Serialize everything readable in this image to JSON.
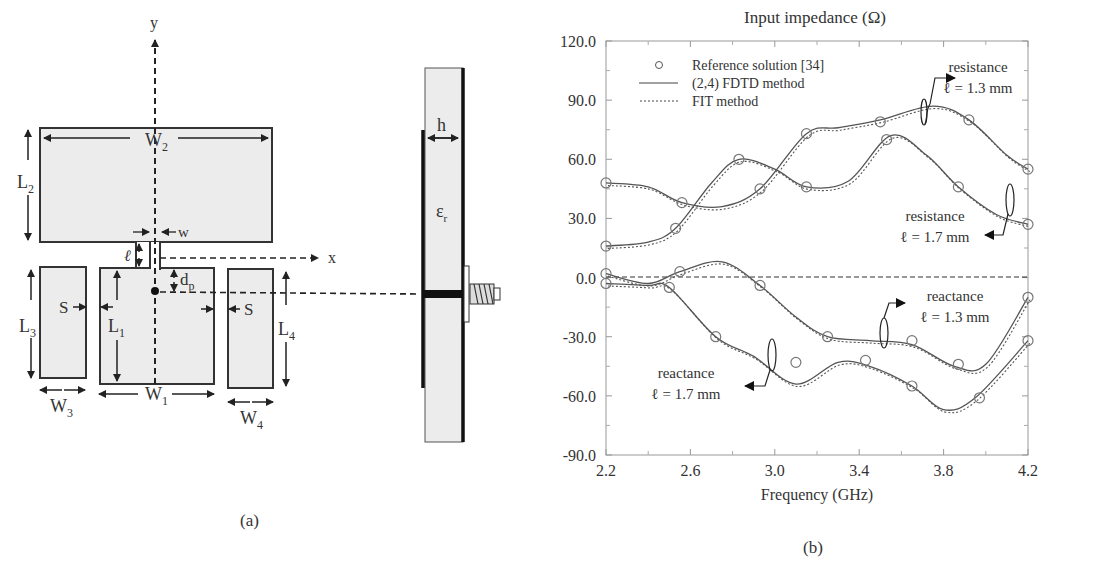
{
  "figure_a": {
    "caption": "(a)",
    "labels": {
      "y_axis": "y",
      "x_axis": "x",
      "W2": "W",
      "W2_sub": "2",
      "L2": "L",
      "L2_sub": "2",
      "w": "w",
      "ell": "ℓ",
      "dp": "d",
      "dp_sub": "p",
      "L3": "L",
      "L3_sub": "3",
      "L1": "L",
      "L1_sub": "1",
      "L4": "L",
      "L4_sub": "4",
      "S_left": "S",
      "S_right": "S",
      "W3": "W",
      "W3_sub": "3",
      "W1": "W",
      "W1_sub": "1",
      "W4": "W",
      "W4_sub": "4",
      "h": "h",
      "eps": "ε",
      "eps_sub": "r"
    }
  },
  "figure_b": {
    "caption": "(b)",
    "annotations": [
      {
        "name": "resistance",
        "sub": "ℓ = 1.3 mm"
      },
      {
        "name": "resistance",
        "sub": "ℓ = 1.7 mm"
      },
      {
        "name": "reactance",
        "sub": "ℓ = 1.3 mm"
      },
      {
        "name": "reactance",
        "sub": "ℓ = 1.7 mm"
      }
    ],
    "legend": [
      {
        "label": "Reference solution [34]",
        "style": "circle"
      },
      {
        "label": "(2,4) FDTD method",
        "style": "solid"
      },
      {
        "label": "FIT method",
        "style": "dotted"
      }
    ]
  },
  "chart_data": {
    "type": "line",
    "title": "Input impedance (Ω)",
    "xlabel": "Frequency (GHz)",
    "ylabel": "",
    "xlim": [
      2.2,
      4.2
    ],
    "ylim": [
      -90,
      120
    ],
    "x_ticks": [
      "2.2",
      "2.6",
      "3.0",
      "3.4",
      "3.8",
      "4.2"
    ],
    "y_ticks": [
      "120.0",
      "90.0",
      "60.0",
      "30.0",
      "0.0",
      "-30.0",
      "-60.0",
      "-90.0"
    ],
    "grid": false,
    "legend_position": "upper left",
    "series": [
      {
        "name": "resistance ℓ = 1.3 mm (FDTD)",
        "x": [
          2.2,
          2.4,
          2.56,
          2.75,
          2.93,
          3.15,
          3.3,
          3.5,
          3.75,
          3.92,
          4.1,
          4.2
        ],
        "values": [
          48,
          46,
          38,
          36,
          45,
          73,
          76,
          80,
          87,
          80,
          62,
          55
        ]
      },
      {
        "name": "resistance ℓ = 1.7 mm (FDTD)",
        "x": [
          2.2,
          2.4,
          2.53,
          2.7,
          2.83,
          3.0,
          3.15,
          3.35,
          3.55,
          3.72,
          3.87,
          4.05,
          4.2
        ],
        "values": [
          16,
          18,
          25,
          48,
          60,
          55,
          46,
          49,
          72,
          62,
          46,
          32,
          27
        ]
      },
      {
        "name": "reactance ℓ = 1.3 mm (FDTD)",
        "x": [
          2.2,
          2.4,
          2.55,
          2.75,
          2.93,
          3.1,
          3.25,
          3.45,
          3.65,
          3.85,
          4.0,
          4.2
        ],
        "values": [
          2,
          -3,
          3,
          8,
          -4,
          -20,
          -30,
          -32,
          -34,
          -45,
          -44,
          -10
        ]
      },
      {
        "name": "reactance ℓ = 1.7 mm (FDTD)",
        "x": [
          2.2,
          2.4,
          2.5,
          2.72,
          2.9,
          3.1,
          3.3,
          3.45,
          3.65,
          3.8,
          3.95,
          4.2
        ],
        "values": [
          -3,
          -4,
          -5,
          -30,
          -40,
          -54,
          -43,
          -45,
          -55,
          -67,
          -61,
          -32
        ]
      }
    ],
    "reference_points": {
      "resistance_1.3": [
        [
          2.2,
          48
        ],
        [
          2.56,
          38
        ],
        [
          2.93,
          45
        ],
        [
          3.15,
          73
        ],
        [
          3.5,
          79
        ],
        [
          3.92,
          80
        ],
        [
          4.2,
          55
        ]
      ],
      "resistance_1.7": [
        [
          2.2,
          16
        ],
        [
          2.53,
          25
        ],
        [
          2.83,
          60
        ],
        [
          3.15,
          46
        ],
        [
          3.53,
          70
        ],
        [
          3.87,
          46
        ],
        [
          4.2,
          27
        ]
      ],
      "reactance_1.3": [
        [
          2.2,
          2
        ],
        [
          2.55,
          3
        ],
        [
          2.93,
          -4
        ],
        [
          3.25,
          -30
        ],
        [
          3.65,
          -32
        ],
        [
          3.87,
          -44
        ],
        [
          4.2,
          -10
        ]
      ],
      "reactance_1.7": [
        [
          2.2,
          -3
        ],
        [
          2.5,
          -5
        ],
        [
          2.72,
          -30
        ],
        [
          3.1,
          -43
        ],
        [
          3.43,
          -42
        ],
        [
          3.65,
          -55
        ],
        [
          3.97,
          -61
        ],
        [
          4.2,
          -32
        ]
      ]
    }
  }
}
